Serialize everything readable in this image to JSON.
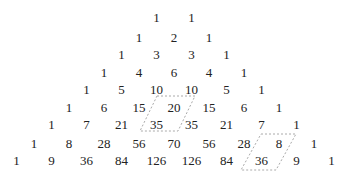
{
  "rows": [
    [
      1,
      1
    ],
    [
      1,
      2,
      1
    ],
    [
      1,
      3,
      3,
      1
    ],
    [
      1,
      4,
      6,
      4,
      1
    ],
    [
      1,
      5,
      10,
      10,
      5,
      1
    ],
    [
      1,
      6,
      15,
      20,
      15,
      6,
      1
    ],
    [
      1,
      7,
      21,
      35,
      35,
      21,
      7,
      1
    ],
    [
      1,
      8,
      28,
      56,
      70,
      56,
      28,
      8,
      1
    ],
    [
      1,
      9,
      36,
      84,
      126,
      126,
      84,
      36,
      9,
      1
    ]
  ],
  "highlights": [
    {
      "label": "parallelogram-20-35",
      "cells": [
        [
          5,
          3
        ],
        [
          6,
          3
        ]
      ],
      "values": [
        20,
        35
      ],
      "style": "dashed",
      "color": "#aaaaaa"
    },
    {
      "label": "parallelogram-8-36",
      "cells": [
        [
          7,
          7
        ],
        [
          8,
          7
        ]
      ],
      "values": [
        8,
        36
      ],
      "style": "dashed",
      "color": "#aaaaaa"
    }
  ]
}
